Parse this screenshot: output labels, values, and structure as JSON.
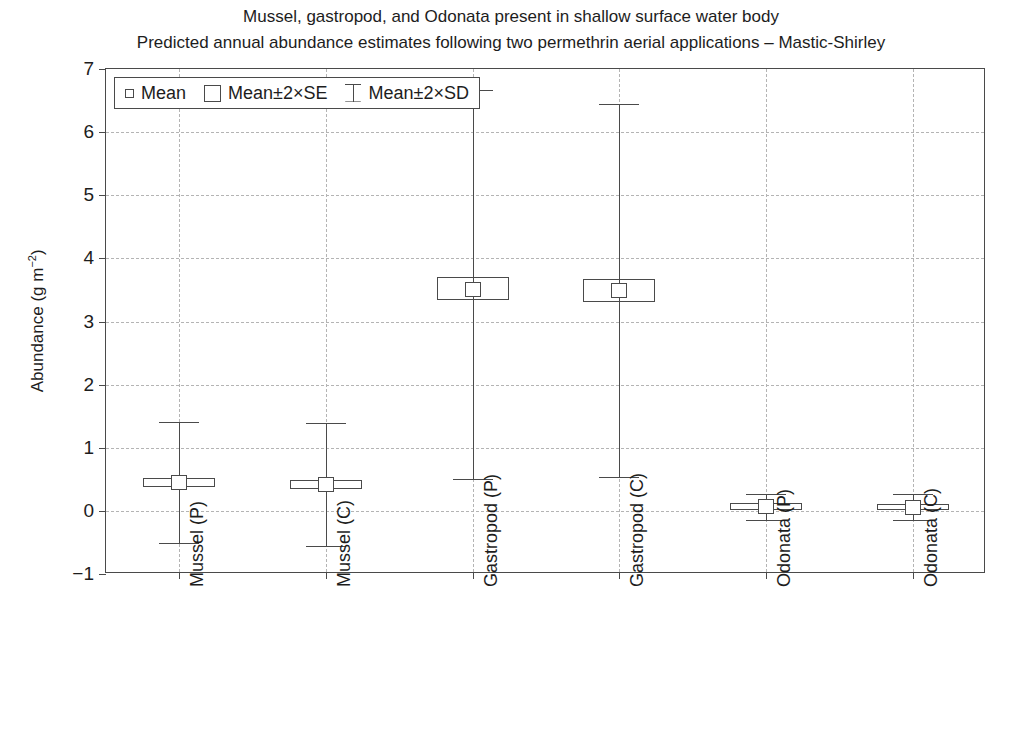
{
  "chart_data": {
    "type": "box",
    "title": "Mussel, gastropod, and Odonata present in shallow surface water body",
    "subtitle": "Predicted annual abundance estimates following two permethrin aerial applications – Mastic-Shirley",
    "xlabel": "",
    "ylabel": "Abundance (g m⁻²)",
    "ylabel_base": "Abundance (g m",
    "ylabel_sup": "−2",
    "ylabel_tail": ")",
    "ylim": [
      -1,
      7
    ],
    "yticks": [
      "7",
      "6",
      "5",
      "4",
      "3",
      "2",
      "1",
      "0",
      "−1"
    ],
    "ytick_values": [
      7,
      6,
      5,
      4,
      3,
      2,
      1,
      0,
      -1
    ],
    "grid": true,
    "grid_style": "dashed",
    "legend_position": "top-left",
    "categories": [
      "Mussel (P)",
      "Mussel (C)",
      "Gastropod (P)",
      "Gastropod (C)",
      "Odonata (P)",
      "Odonata (C)"
    ],
    "legend": [
      {
        "label": "Mean",
        "marker": "small-open-square"
      },
      {
        "label": "Mean±2×SE",
        "marker": "open-box"
      },
      {
        "label": "Mean±2×SD",
        "marker": "whisker-bar"
      }
    ],
    "series": [
      {
        "name": "Mussel (P)",
        "mean": 0.45,
        "se_low": 0.38,
        "se_high": 0.52,
        "sd_low": -0.51,
        "sd_high": 1.41
      },
      {
        "name": "Mussel (C)",
        "mean": 0.42,
        "se_low": 0.35,
        "se_high": 0.49,
        "sd_low": -0.56,
        "sd_high": 1.4
      },
      {
        "name": "Gastropod (P)",
        "mean": 3.52,
        "se_low": 3.34,
        "se_high": 3.7,
        "sd_low": 0.5,
        "sd_high": 6.66
      },
      {
        "name": "Gastropod (C)",
        "mean": 3.5,
        "se_low": 3.31,
        "se_high": 3.68,
        "sd_low": 0.53,
        "sd_high": 6.45
      },
      {
        "name": "Odonata (P)",
        "mean": 0.07,
        "se_low": 0.02,
        "se_high": 0.12,
        "sd_low": -0.14,
        "sd_high": 0.27
      },
      {
        "name": "Odonata (C)",
        "mean": 0.06,
        "se_low": 0.01,
        "se_high": 0.11,
        "sd_low": -0.15,
        "sd_high": 0.26
      }
    ],
    "colors": {
      "axis": "#4a4a4a",
      "grid": "#b4b4b4",
      "marker": "#4a4a4a",
      "text": "#1d1d1d",
      "background": "#ffffff"
    }
  }
}
